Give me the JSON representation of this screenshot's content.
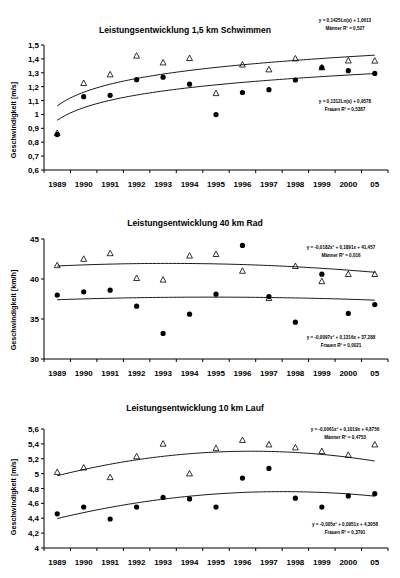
{
  "document": {
    "title": "Leistungsentwicklung Triathlon Teildisziplinen",
    "background_color": "#ffffff",
    "marker_color": "#000000"
  },
  "charts": [
    {
      "id": "chart-1",
      "title": "Leistungsentwicklung 1,5 km Schwimmen",
      "ylabel": "Geschwindigkeit [m/s]",
      "xlabel": "",
      "annotation_top": {
        "line1": "y = 0,1425Ln(x) + 1,0613",
        "line2": "Männer R² = 0,527"
      },
      "annotation_bottom": {
        "line1": "y = 0,1312Ln(x) + 0,9578",
        "line2": "Frauen R² = 0,5387"
      }
    },
    {
      "id": "chart-2",
      "title": "Leistungsentwicklung 40 km Rad",
      "ylabel": "Geschwindigkeit [km/h]",
      "xlabel": "",
      "annotation_top": {
        "line1": "y = -0,0182x² + 0,1891x + 41,457",
        "line2": "Männer R² = 0,016"
      },
      "annotation_bottom": {
        "line1": "y = -0,0097x² + 0,1316x + 37,288",
        "line2": "Frauen R² = 0,0021"
      }
    },
    {
      "id": "chart-3",
      "title": "Leistungsentwicklung 10 km Lauf",
      "ylabel": "Geschwindigkeit [m/s]",
      "xlabel": "",
      "annotation_top": {
        "line1": "y = -0,0061x² + 0,1019x + 4,8756",
        "line2": "Männer R² = 0,4753"
      },
      "annotation_bottom": {
        "line1": "y = -0,005x² + 0,0951x + 4,3058",
        "line2": "Frauen R² = 0,3791"
      }
    }
  ],
  "chart_data": [
    {
      "type": "scatter",
      "title": "Leistungsentwicklung 1,5 km Schwimmen",
      "xlabel": "",
      "ylabel": "Geschwindigkeit [m/s]",
      "categories": [
        "1989",
        "1990",
        "1991",
        "1992",
        "1993",
        "1994",
        "1995",
        "1996",
        "1997",
        "1998",
        "1999",
        "2000",
        "05"
      ],
      "ylim": [
        0.6,
        1.5
      ],
      "yticks": [
        "0,6",
        "0,7",
        "0,8",
        "0,9",
        "1",
        "1,1",
        "1,2",
        "1,3",
        "1,4",
        "1,5"
      ],
      "ytick_values": [
        0.6,
        0.7,
        0.8,
        0.9,
        1.0,
        1.1,
        1.2,
        1.3,
        1.4,
        1.5
      ],
      "grid": false,
      "legend": "none",
      "series": [
        {
          "name": "Männer",
          "marker": "triangle",
          "values": [
            0.865,
            1.225,
            1.287,
            1.422,
            1.373,
            1.405,
            1.152,
            1.358,
            1.323,
            1.402,
            1.338,
            1.387,
            1.386
          ],
          "trendline": {
            "type": "log",
            "equation": "y = 0,1425Ln(x) + 1,0613",
            "r2": "0,527",
            "a": 0.1425,
            "b": 1.0613
          }
        },
        {
          "name": "Frauen",
          "marker": "circle",
          "values": [
            0.855,
            1.128,
            1.138,
            1.25,
            1.268,
            1.218,
            0.999,
            1.158,
            1.178,
            1.248,
            1.338,
            1.315,
            1.295
          ],
          "trendline": {
            "type": "log",
            "equation": "y = 0,1312Ln(x) + 0,9578",
            "r2": "0,5387",
            "a": 0.1312,
            "b": 0.9578
          }
        }
      ]
    },
    {
      "type": "scatter",
      "title": "Leistungsentwicklung 40 km Rad",
      "xlabel": "",
      "ylabel": "Geschwindigkeit [km/h]",
      "categories": [
        "1989",
        "1990",
        "1991",
        "1992",
        "1993",
        "1994",
        "1995",
        "1996",
        "1997",
        "1998",
        "1999",
        "2000",
        "05"
      ],
      "ylim": [
        30,
        45
      ],
      "yticks": [
        "30",
        "35",
        "40",
        "45"
      ],
      "ytick_values": [
        30,
        35,
        40,
        45
      ],
      "grid": false,
      "legend": "none",
      "series": [
        {
          "name": "Männer",
          "marker": "triangle",
          "values": [
            41.7,
            42.5,
            43.2,
            40.1,
            39.9,
            42.9,
            43.1,
            41.0,
            37.6,
            41.6,
            39.7,
            40.6,
            40.6
          ],
          "trendline": {
            "type": "poly2",
            "equation": "y = -0,0182x² + 0,1891x + 41,457",
            "r2": "0,016",
            "a": -0.0182,
            "b": 0.1891,
            "c": 41.457
          }
        },
        {
          "name": "Frauen",
          "marker": "circle",
          "values": [
            38.0,
            38.4,
            38.6,
            36.6,
            33.2,
            35.6,
            38.1,
            44.2,
            37.8,
            34.6,
            40.6,
            35.7,
            36.8
          ],
          "trendline": {
            "type": "poly2",
            "equation": "y = -0,0097x² + 0,1316x + 37,288",
            "r2": "0,0021",
            "a": -0.0097,
            "b": 0.1316,
            "c": 37.288
          }
        }
      ]
    },
    {
      "type": "scatter",
      "title": "Leistungsentwicklung 10 km Lauf",
      "xlabel": "",
      "ylabel": "Geschwindigkeit [m/s]",
      "categories": [
        "1989",
        "1990",
        "1991",
        "1992",
        "1993",
        "1994",
        "1995",
        "1996",
        "1997",
        "1998",
        "1999",
        "2000",
        "05"
      ],
      "ylim": [
        4.0,
        5.6
      ],
      "yticks": [
        "4",
        "4,2",
        "4,4",
        "4,6",
        "4,8",
        "5",
        "5,2",
        "5,4",
        "5,6"
      ],
      "ytick_values": [
        4.0,
        4.2,
        4.4,
        4.6,
        4.8,
        5.0,
        5.2,
        5.4,
        5.6
      ],
      "grid": false,
      "legend": "none",
      "series": [
        {
          "name": "Männer",
          "marker": "triangle",
          "values": [
            5.02,
            5.08,
            4.95,
            5.23,
            5.4,
            5.0,
            5.34,
            5.45,
            5.39,
            5.35,
            5.3,
            5.25,
            5.39
          ],
          "trendline": {
            "type": "poly2",
            "equation": "y = -0,0061x² + 0,1019x + 4,8756",
            "r2": "0,4753",
            "a": -0.0061,
            "b": 0.1019,
            "c": 4.8756
          }
        },
        {
          "name": "Frauen",
          "marker": "circle",
          "values": [
            4.46,
            4.55,
            4.39,
            4.55,
            4.68,
            4.66,
            4.55,
            4.94,
            5.07,
            4.67,
            4.55,
            4.7,
            4.73
          ],
          "trendline": {
            "type": "poly2",
            "equation": "y = -0,005x² + 0,0951x + 4,3058",
            "r2": "0,3791",
            "a": -0.005,
            "b": 0.0951,
            "c": 4.3058
          }
        }
      ]
    }
  ]
}
